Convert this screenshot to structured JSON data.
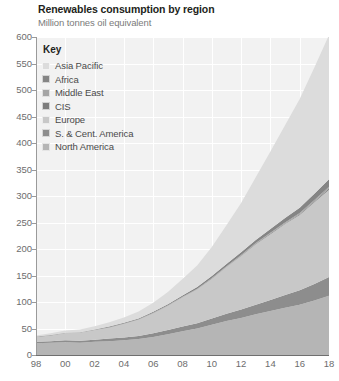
{
  "chart_data": {
    "type": "area",
    "title": "Renewables consumption by region",
    "subtitle": "Million tonnes oil equivalent",
    "xlabel": "",
    "ylabel": "",
    "stacked": true,
    "grid": true,
    "legend_position": "top-left",
    "legend_title": "Key",
    "ylim": [
      0,
      600
    ],
    "ytick_labels": [
      "600",
      "550",
      "500",
      "450",
      "400",
      "350",
      "300",
      "250",
      "200",
      "150",
      "100",
      "50",
      "0"
    ],
    "ytick_values": [
      600,
      550,
      500,
      450,
      400,
      350,
      300,
      250,
      200,
      150,
      100,
      50,
      0
    ],
    "xlim": [
      1998,
      2018
    ],
    "xtick_labels": [
      "98",
      "00",
      "02",
      "04",
      "06",
      "08",
      "10",
      "12",
      "14",
      "16",
      "18"
    ],
    "xtick_values": [
      1998,
      2000,
      2002,
      2004,
      2006,
      2008,
      2010,
      2012,
      2014,
      2016,
      2018
    ],
    "x": [
      1998,
      1999,
      2000,
      2001,
      2002,
      2003,
      2004,
      2005,
      2006,
      2007,
      2008,
      2009,
      2010,
      2011,
      2012,
      2013,
      2014,
      2015,
      2016,
      2017,
      2018
    ],
    "series": [
      {
        "name": "North America",
        "color": "#b5b5b5",
        "values": [
          22,
          23,
          24,
          23,
          25,
          26,
          28,
          30,
          34,
          39,
          45,
          50,
          57,
          64,
          70,
          77,
          83,
          89,
          95,
          103,
          112
        ]
      },
      {
        "name": "S. & Cent. America",
        "color": "#8d8d8d",
        "values": [
          3,
          3,
          4,
          4,
          4,
          5,
          5,
          6,
          7,
          8,
          9,
          10,
          12,
          14,
          16,
          18,
          21,
          24,
          27,
          31,
          35
        ]
      },
      {
        "name": "Europe",
        "color": "#c8c8c8",
        "values": [
          9,
          11,
          13,
          15,
          18,
          21,
          26,
          31,
          38,
          46,
          55,
          64,
          75,
          88,
          101,
          114,
          124,
          134,
          142,
          154,
          165
        ]
      },
      {
        "name": "CIS",
        "color": "#7c7c7c",
        "values": [
          0.2,
          0.2,
          0.2,
          0.2,
          0.2,
          0.3,
          0.3,
          0.3,
          0.3,
          0.4,
          0.4,
          0.5,
          0.6,
          0.7,
          0.8,
          0.9,
          1.1,
          1.3,
          1.5,
          1.8,
          2.2
        ]
      },
      {
        "name": "Middle East",
        "color": "#a5a5a5",
        "values": [
          0.1,
          0.1,
          0.1,
          0.1,
          0.2,
          0.2,
          0.2,
          0.2,
          0.3,
          0.3,
          0.4,
          0.5,
          0.6,
          0.8,
          1.0,
          1.2,
          1.5,
          1.9,
          2.3,
          2.8,
          3.4
        ]
      },
      {
        "name": "Africa",
        "color": "#858585",
        "values": [
          0.5,
          0.6,
          0.7,
          0.8,
          0.9,
          1.1,
          1.3,
          1.5,
          1.8,
          2.2,
          2.6,
          3.1,
          3.7,
          4.4,
          5.2,
          6.1,
          7.2,
          8.5,
          10.0,
          11.8,
          14.0
        ]
      },
      {
        "name": "Asia Pacific",
        "color": "#dcdcdc",
        "values": [
          2,
          3,
          4,
          5,
          6,
          8,
          10,
          13,
          17,
          23,
          31,
          41,
          55,
          73,
          93,
          118,
          146,
          175,
          205,
          238,
          272
        ]
      }
    ]
  },
  "legend": {
    "title": "Key",
    "items": [
      {
        "label": "Asia Pacific",
        "color": "#dcdcdc"
      },
      {
        "label": "Africa",
        "color": "#858585"
      },
      {
        "label": "Middle East",
        "color": "#a5a5a5"
      },
      {
        "label": "CIS",
        "color": "#7c7c7c"
      },
      {
        "label": "Europe",
        "color": "#c8c8c8"
      },
      {
        "label": "S. & Cent. America",
        "color": "#8d8d8d"
      },
      {
        "label": "North America",
        "color": "#b5b5b5"
      }
    ]
  },
  "colors": {
    "plot_background": "#f2f2f2",
    "gridline": "#ffffff",
    "axis": "#6f6f6f",
    "tick_text": "#6d6d6d",
    "title_text": "#231f20",
    "subtitle_text": "#7b7b7b"
  }
}
